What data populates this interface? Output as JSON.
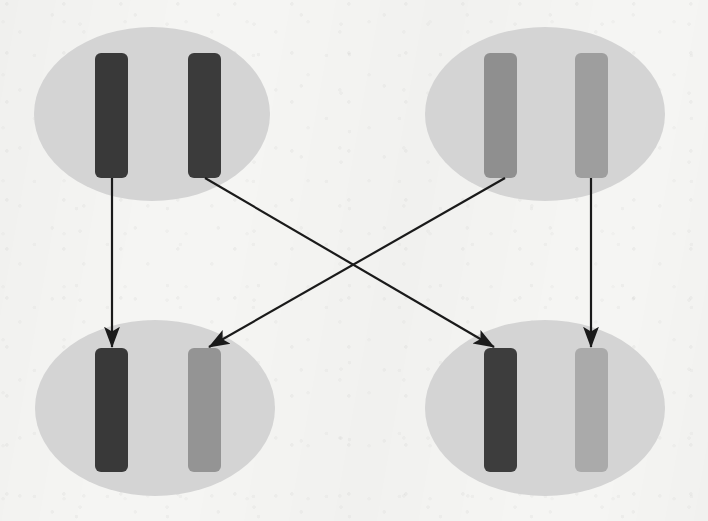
{
  "figure": {
    "title": "",
    "background_color": "#f5f5f3",
    "width": 708,
    "height": 521
  },
  "palette": {
    "background": "#f5f5f3",
    "group_fill": "#d4d4d4",
    "bar_dark": "#393939",
    "bar_dark_alt": "#3d3d3d",
    "bar_medium": "#8f8f8f",
    "bar_medium_light": "#9e9e9e",
    "bar_light": "#aaaaaa",
    "bar_gray_mid": "#949494",
    "arrow": "#1a1a1a"
  },
  "groups": [
    {
      "id": "group-top-left",
      "label": "",
      "cx": 152,
      "cy": 114,
      "rx": 118,
      "ry": 87,
      "fill": "#d4d4d4",
      "bars": [
        {
          "id": "bar-tl-1",
          "x": 95,
          "y": 53,
          "w": 33,
          "h": 125,
          "fill": "#393939",
          "shade": "dark"
        },
        {
          "id": "bar-tl-2",
          "x": 188,
          "y": 53,
          "w": 33,
          "h": 125,
          "fill": "#3b3b3b",
          "shade": "dark"
        }
      ]
    },
    {
      "id": "group-top-right",
      "label": "",
      "cx": 545,
      "cy": 114,
      "rx": 120,
      "ry": 87,
      "fill": "#d4d4d4",
      "bars": [
        {
          "id": "bar-tr-1",
          "x": 484,
          "y": 53,
          "w": 33,
          "h": 125,
          "fill": "#8f8f8f",
          "shade": "medium"
        },
        {
          "id": "bar-tr-2",
          "x": 575,
          "y": 53,
          "w": 33,
          "h": 125,
          "fill": "#9e9e9e",
          "shade": "medium-light"
        }
      ]
    },
    {
      "id": "group-bottom-left",
      "label": "",
      "cx": 155,
      "cy": 408,
      "rx": 120,
      "ry": 88,
      "fill": "#d4d4d4",
      "bars": [
        {
          "id": "bar-bl-1",
          "x": 95,
          "y": 348,
          "w": 33,
          "h": 124,
          "fill": "#393939",
          "shade": "dark"
        },
        {
          "id": "bar-bl-2",
          "x": 188,
          "y": 348,
          "w": 33,
          "h": 124,
          "fill": "#949494",
          "shade": "medium"
        }
      ]
    },
    {
      "id": "group-bottom-right",
      "label": "",
      "cx": 545,
      "cy": 408,
      "rx": 120,
      "ry": 88,
      "fill": "#d4d4d4",
      "bars": [
        {
          "id": "bar-br-1",
          "x": 484,
          "y": 348,
          "w": 33,
          "h": 124,
          "fill": "#3d3d3d",
          "shade": "dark"
        },
        {
          "id": "bar-br-2",
          "x": 575,
          "y": 348,
          "w": 33,
          "h": 124,
          "fill": "#aaaaaa",
          "shade": "light"
        }
      ]
    }
  ],
  "arrows": [
    {
      "id": "arrow-tl1-to-bl1",
      "from_bar": "bar-tl-1",
      "to_bar": "bar-bl-1",
      "x1": 112,
      "y1": 178,
      "x2": 112,
      "y2": 347,
      "kind": "vertical"
    },
    {
      "id": "arrow-tl2-to-br1",
      "from_bar": "bar-tl-2",
      "to_bar": "bar-br-1",
      "x1": 205,
      "y1": 178,
      "x2": 494,
      "y2": 347,
      "kind": "diagonal-down-right"
    },
    {
      "id": "arrow-tr1-to-bl2",
      "from_bar": "bar-tr-1",
      "to_bar": "bar-bl-2",
      "x1": 505,
      "y1": 178,
      "x2": 209,
      "y2": 347,
      "kind": "diagonal-down-left"
    },
    {
      "id": "arrow-tr2-to-br2",
      "from_bar": "bar-tr-2",
      "to_bar": "bar-br-2",
      "x1": 591,
      "y1": 178,
      "x2": 591,
      "y2": 347,
      "kind": "vertical"
    }
  ],
  "arrow_style": {
    "stroke": "#1a1a1a",
    "stroke_width": 2.2,
    "head_length": 13,
    "head_width": 9
  }
}
